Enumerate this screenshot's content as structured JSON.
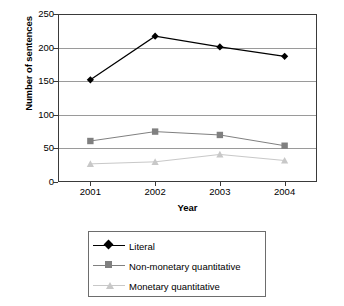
{
  "chart_data": {
    "type": "line",
    "title": "",
    "xlabel": "Year",
    "ylabel": "Number of sentences",
    "categories": [
      "2001",
      "2002",
      "2003",
      "2004"
    ],
    "x": [
      2001,
      2002,
      2003,
      2004
    ],
    "ylim": [
      0,
      250
    ],
    "yticks": [
      0,
      50,
      100,
      150,
      200,
      250
    ],
    "ytick_labels": [
      "0",
      "50",
      "100",
      "150",
      "200",
      "250"
    ],
    "grid": "horizontal",
    "legend_position": "bottom",
    "series": [
      {
        "name": "Literal",
        "values": [
          152,
          217,
          201,
          187
        ],
        "color": "#000000",
        "marker": "diamond"
      },
      {
        "name": "Non-monetary quantitative",
        "values": [
          61,
          75,
          70,
          54
        ],
        "color": "#808080",
        "marker": "square"
      },
      {
        "name": "Monetary quantitative",
        "values": [
          27,
          30,
          41,
          32
        ],
        "color": "#c8c8c8",
        "marker": "triangle"
      }
    ]
  },
  "axes": {
    "y_title": "Number of sentences",
    "x_title": "Year"
  },
  "legend": {
    "items": [
      {
        "label": "Literal",
        "color": "#000000",
        "marker": "diamond-marker"
      },
      {
        "label": "Non-monetary quantitative",
        "color": "#808080",
        "marker": "square-marker"
      },
      {
        "label": "Monetary quantitative",
        "color": "#c8c8c8",
        "marker": "triangle-marker"
      }
    ]
  }
}
